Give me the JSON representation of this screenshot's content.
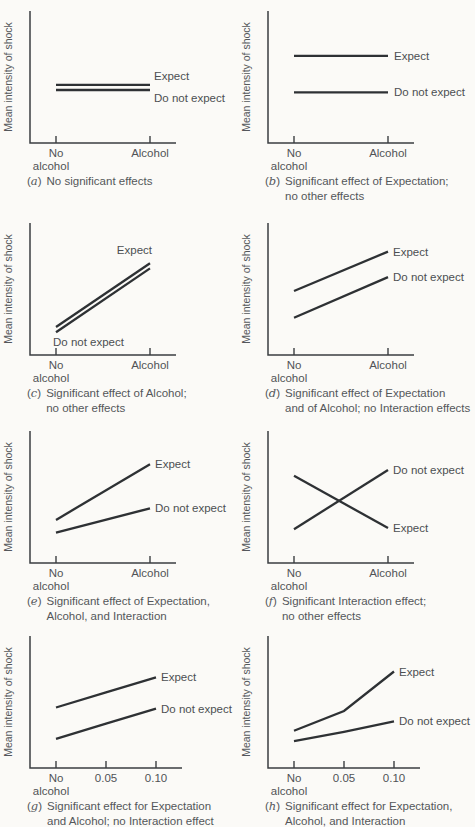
{
  "colors": {
    "background": "#fbfaf7",
    "axis": "#3b3e41",
    "data_line": "#2e3134",
    "text": "#54575a"
  },
  "chart_data": {
    "type": "line",
    "layout": "4x2 grid of small multiples, shared y-axis label, no gridlines, series labeled inline",
    "ylim": [
      0,
      1
    ],
    "panels": [
      {
        "id": "a",
        "ylabel": "Mean intensity of shock",
        "x_categories": [
          "No alcohol",
          "Alcohol"
        ],
        "x_tick_labels": [
          [
            "No",
            "alcohol"
          ],
          [
            "Alcohol"
          ]
        ],
        "caption_letter": "a",
        "caption_lines": [
          "No significant effects"
        ],
        "series": [
          {
            "name": "Expect",
            "values": [
              0.45,
              0.45
            ],
            "label": {
              "at": "end",
              "align": "start",
              "dx": 4,
              "dy": -5
            }
          },
          {
            "name": "Do not expect",
            "values": [
              0.405,
              0.405
            ],
            "label": {
              "at": "end",
              "align": "start",
              "dx": 4,
              "dy": 12
            }
          }
        ]
      },
      {
        "id": "b",
        "ylabel": "Mean intensity of shock",
        "x_categories": [
          "No alcohol",
          "Alcohol"
        ],
        "x_tick_labels": [
          [
            "No",
            "alcohol"
          ],
          [
            "Alcohol"
          ]
        ],
        "caption_letter": "b",
        "caption_lines": [
          "Significant effect of Expectation;",
          "no other effects"
        ],
        "series": [
          {
            "name": "Expect",
            "values": [
              0.7,
              0.7
            ],
            "label": {
              "at": "end",
              "align": "start",
              "dx": 6,
              "dy": 4
            }
          },
          {
            "name": "Do not expect",
            "values": [
              0.385,
              0.385
            ],
            "label": {
              "at": "end",
              "align": "start",
              "dx": 6,
              "dy": 4
            }
          }
        ]
      },
      {
        "id": "c",
        "ylabel": "Mean intensity of shock",
        "x_categories": [
          "No alcohol",
          "Alcohol"
        ],
        "x_tick_labels": [
          [
            "No",
            "alcohol"
          ],
          [
            "Alcohol"
          ]
        ],
        "caption_letter": "c",
        "caption_lines": [
          "Significant effect of Alcohol;",
          "no other effects"
        ],
        "series": [
          {
            "name": "Expect",
            "values": [
              0.19,
              0.74
            ],
            "label": {
              "at": "end",
              "align": "end",
              "dx": 2,
              "dy": -9
            }
          },
          {
            "name": "Do not expect",
            "values": [
              0.145,
              0.695
            ],
            "label": {
              "at": "start",
              "align": "start",
              "dx": -3,
              "dy": 14
            }
          }
        ]
      },
      {
        "id": "d",
        "ylabel": "Mean intensity of shock",
        "x_categories": [
          "No alcohol",
          "Alcohol"
        ],
        "x_tick_labels": [
          [
            "No",
            "alcohol"
          ],
          [
            "Alcohol"
          ]
        ],
        "caption_letter": "d",
        "caption_lines": [
          "Significant effect of Expectation",
          "and of Alcohol; no Interaction effects"
        ],
        "series": [
          {
            "name": "Expect",
            "values": [
              0.5,
              0.84
            ],
            "label": {
              "at": "end",
              "align": "start",
              "dx": 5,
              "dy": 4
            }
          },
          {
            "name": "Do not expect",
            "values": [
              0.27,
              0.62
            ],
            "label": {
              "at": "end",
              "align": "start",
              "dx": 5,
              "dy": 4
            }
          }
        ]
      },
      {
        "id": "e",
        "ylabel": "Mean intensity of shock",
        "x_categories": [
          "No alcohol",
          "Alcohol"
        ],
        "x_tick_labels": [
          [
            "No",
            "alcohol"
          ],
          [
            "Alcohol"
          ]
        ],
        "caption_letter": "e",
        "caption_lines": [
          "Significant effect of Expectation,",
          "Alcohol, and Interaction"
        ],
        "series": [
          {
            "name": "Expect",
            "values": [
              0.32,
              0.8
            ],
            "label": {
              "at": "end",
              "align": "start",
              "dx": 5,
              "dy": 4
            }
          },
          {
            "name": "Do not expect",
            "values": [
              0.21,
              0.42
            ],
            "label": {
              "at": "end",
              "align": "start",
              "dx": 5,
              "dy": 4
            }
          }
        ]
      },
      {
        "id": "f",
        "ylabel": "Mean intensity of shock",
        "x_categories": [
          "No alcohol",
          "Alcohol"
        ],
        "x_tick_labels": [
          [
            "No",
            "alcohol"
          ],
          [
            "Alcohol"
          ]
        ],
        "caption_letter": "f",
        "caption_lines": [
          "Significant Interaction effect;",
          "no other effects"
        ],
        "series": [
          {
            "name": "Do not expect",
            "values": [
              0.24,
              0.75
            ],
            "label": {
              "at": "end",
              "align": "start",
              "dx": 5,
              "dy": 4
            }
          },
          {
            "name": "Expect",
            "values": [
              0.7,
              0.25
            ],
            "label": {
              "at": "end",
              "align": "start",
              "dx": 5,
              "dy": 4
            }
          }
        ]
      },
      {
        "id": "g",
        "ylabel": "Mean intensity of shock",
        "x_categories": [
          "No alcohol",
          "0.05",
          "0.10"
        ],
        "x_tick_labels": [
          [
            "No",
            "alcohol"
          ],
          [
            "0.05"
          ],
          [
            "0.10"
          ]
        ],
        "caption_letter": "g",
        "caption_lines": [
          "Significant effect for Expectation",
          "and Alcohol; no Interaction effect"
        ],
        "series": [
          {
            "name": "Expect",
            "values": [
              0.47,
              0.6,
              0.73
            ],
            "label": {
              "at": "end",
              "align": "start",
              "dx": 5,
              "dy": 4
            }
          },
          {
            "name": "Do not expect",
            "values": [
              0.2,
              0.33,
              0.46
            ],
            "label": {
              "at": "end",
              "align": "start",
              "dx": 5,
              "dy": 4
            }
          }
        ]
      },
      {
        "id": "h",
        "ylabel": "Mean intensity of shock",
        "x_categories": [
          "No alcohol",
          "0.05",
          "0.10"
        ],
        "x_tick_labels": [
          [
            "No",
            "alcohol"
          ],
          [
            "0.05"
          ],
          [
            "0.10"
          ]
        ],
        "caption_letter": "h",
        "caption_lines": [
          "Significant effect for Expectation,",
          "Alcohol, and Interaction"
        ],
        "series": [
          {
            "name": "Expect",
            "values": [
              0.27,
              0.44,
              0.78
            ],
            "label": {
              "at": "end",
              "align": "start",
              "dx": 5,
              "dy": 4
            }
          },
          {
            "name": "Do not expect",
            "values": [
              0.18,
              0.26,
              0.35
            ],
            "label": {
              "at": "end",
              "align": "start",
              "dx": 5,
              "dy": 4
            }
          }
        ]
      }
    ]
  }
}
